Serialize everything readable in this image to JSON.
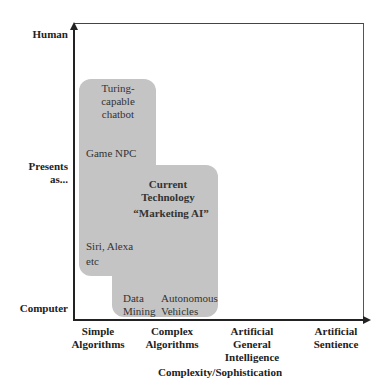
{
  "diagram": {
    "y_axis": {
      "title": "Presents as...",
      "labels": {
        "top": "Human",
        "middle_line1": "Presents",
        "middle_line2": "as...",
        "bottom": "Computer"
      }
    },
    "x_axis": {
      "title": "Complexity/Sophistication",
      "ticks": [
        {
          "line1": "Simple",
          "line2": "Algorithms",
          "line3": ""
        },
        {
          "line1": "Complex",
          "line2": "Algorithms",
          "line3": ""
        },
        {
          "line1": "Artificial",
          "line2": "General",
          "line3": "Intelligence"
        },
        {
          "line1": "Artificial",
          "line2": "Sentience",
          "line3": ""
        }
      ]
    },
    "region": {
      "color": "#c4c4c4",
      "title_line1": "Current",
      "title_line2": "Technology",
      "subtitle": "“Marketing AI”"
    },
    "items": {
      "turing_line1": "Turing-",
      "turing_line2": "capable",
      "turing_line3": "chatbot",
      "game_npc": "Game NPC",
      "siri_line1": "Siri, Alexa",
      "siri_line2": "etc",
      "data_mining_line1": "Data",
      "data_mining_line2": "Mining",
      "autonomous_line1": "Autonomous",
      "autonomous_line2": "Vehicles"
    }
  }
}
